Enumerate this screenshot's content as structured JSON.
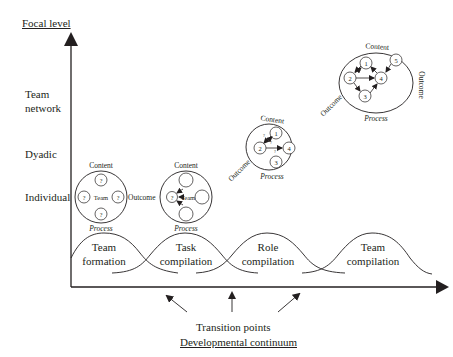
{
  "axes": {
    "y_title": "Focal level",
    "x_title": "Developmental continuum",
    "transition_label": "Transition points"
  },
  "levels": [
    {
      "label_line1": "Team",
      "label_line2": "network"
    },
    {
      "label_line1": "Dyadic"
    },
    {
      "label_line1": "Individual"
    }
  ],
  "phases": [
    {
      "line1": "Team",
      "line2": "formation"
    },
    {
      "line1": "Task",
      "line2": "compilation"
    },
    {
      "line1": "Role",
      "line2": "compilation"
    },
    {
      "line1": "Team",
      "line2": "compilation"
    }
  ],
  "diagrams": {
    "stage1": {
      "top": "Content",
      "bottom": "Process",
      "center": "Team",
      "side": "Outcome",
      "node_mark": "?"
    },
    "stage2": {
      "top": "Content",
      "bottom": "Process",
      "center": "Team",
      "node_mark": "?"
    },
    "stage3": {
      "top": "Content",
      "bottom": "Process",
      "side": "Outcome",
      "nodes": [
        "1",
        "2",
        "3",
        "4"
      ],
      "edge_mark": "?"
    },
    "stage4": {
      "top": "Content",
      "bottom": "Process",
      "left": "Outcome",
      "right": "Outcome",
      "nodes": [
        "1",
        "2",
        "3",
        "4",
        "5"
      ]
    }
  }
}
